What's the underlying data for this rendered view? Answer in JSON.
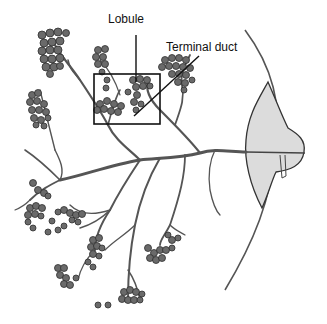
{
  "figure": {
    "labels": {
      "lobule": "Lobule",
      "terminal_duct": "Terminal duct"
    },
    "highlight_box": {
      "x": 94,
      "y": 74,
      "w": 66,
      "h": 50
    },
    "colors": {
      "ink": "#222222",
      "duct": "#555555",
      "lobule_fill": "#6a6a6a",
      "lobule_stroke": "#2e2e2e",
      "nipple_fill": "#dcdcdc"
    }
  }
}
